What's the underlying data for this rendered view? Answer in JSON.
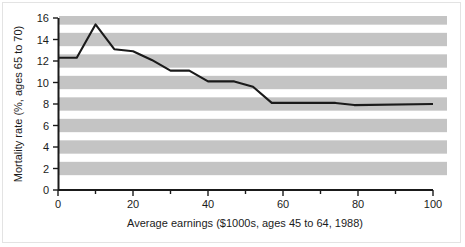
{
  "chart_data": {
    "type": "line",
    "title": "",
    "subtitle": "",
    "xlabel": "Average earnings ($1000s, ages 45 to 64, 1988)",
    "ylabel": "Mortality rate (%, ages 65 to 70)",
    "xlim": [
      0,
      100
    ],
    "ylim": [
      0,
      16
    ],
    "xticks": [
      0,
      20,
      40,
      60,
      80,
      100
    ],
    "xtick_labels": [
      "0",
      "20",
      "40",
      "60",
      "80",
      "100"
    ],
    "xminor_ticks": [
      10,
      30,
      50,
      70,
      90
    ],
    "yticks": [
      0,
      2,
      4,
      6,
      8,
      10,
      12,
      14,
      16
    ],
    "ytick_labels": [
      "0",
      "2",
      "4",
      "6",
      "8",
      "10",
      "12",
      "14",
      "16"
    ],
    "grid": false,
    "banded_background": true,
    "band_values": [
      2,
      4,
      6,
      8,
      10,
      12,
      14,
      16
    ],
    "legend": null,
    "legend_position": "none",
    "annotations": [],
    "series": [
      {
        "name": "Mortality rate",
        "color": "#1a1a1a",
        "x": [
          0,
          5,
          10,
          15,
          20,
          25,
          30,
          35,
          40,
          47,
          52,
          57,
          74,
          79,
          100
        ],
        "values": [
          12.3,
          12.3,
          15.4,
          13.1,
          12.9,
          12.1,
          11.1,
          11.1,
          10.1,
          10.1,
          9.6,
          8.1,
          8.1,
          7.9,
          8.0
        ]
      }
    ]
  },
  "figure": {
    "background_color": "#ffffff",
    "band_color": "#c4c4c4",
    "band_alt_color": "#efefef",
    "axis_color": "#1a1a1a",
    "line_color": "#1a1a1a"
  }
}
